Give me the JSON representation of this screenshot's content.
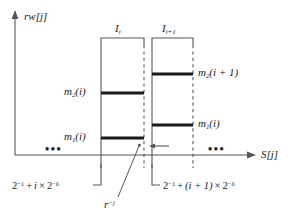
{
  "figure": {
    "background_color": "#ffffff",
    "line_color": "#555555",
    "bar_color": "#1a1a1a",
    "text_color": "#1a1a1a"
  },
  "axes": {
    "y_axis_label": "rw[j]",
    "y_axis_label_parts": {
      "name": "rw",
      "index": "[j]"
    },
    "x_axis_label": "S[j]",
    "x_axis_label_parts": {
      "name": "S",
      "index": "[j]"
    }
  },
  "intervals": [
    {
      "id": "I_i",
      "label_base": "I",
      "label_sub": "i",
      "bracket": true,
      "levels": [
        {
          "name": "m2(i)",
          "base": "m",
          "sub": "2",
          "arg": "(i)",
          "label_side": "left"
        },
        {
          "name": "m1(i)",
          "base": "m",
          "sub": "1",
          "arg": "(i)",
          "label_side": "left"
        }
      ],
      "bound_label": "2^-1 + i x 2^-delta",
      "bound_parts": {
        "two": "2",
        "exp1": "−1",
        "plus": "+",
        "i": "i",
        "times": "×",
        "two2": "2",
        "exp2": "−δ"
      }
    },
    {
      "id": "I_i+1",
      "label_base": "I",
      "label_sub": "i+1",
      "bracket": true,
      "levels": [
        {
          "name": "m2(i + 1)",
          "base": "m",
          "sub": "2",
          "arg": "(i + 1)",
          "label_side": "right"
        },
        {
          "name": "m1(i)",
          "base": "m",
          "sub": "1",
          "arg": "(i)",
          "label_side": "right"
        }
      ],
      "bound_label": "2^-1 + (i + 1) x 2^-delta",
      "bound_parts": {
        "two": "2",
        "exp1": "−1",
        "plus": "+",
        "i": "(i + 1)",
        "times": "×",
        "two2": "2",
        "exp2": "−δ"
      }
    }
  ],
  "annotations": {
    "step_label": "r−j",
    "step_label_parts": {
      "base": "r",
      "exp": "−j"
    },
    "ellipsis_left": "•••",
    "ellipsis_right": "•••"
  },
  "labels": {
    "m2_i": {
      "base": "m",
      "sub": "2",
      "arg": "(i)"
    },
    "m1_i": {
      "base": "m",
      "sub": "1",
      "arg": "(i)"
    },
    "m2_ip1": {
      "base": "m",
      "sub": "2",
      "arg": "(i + 1)"
    },
    "m1_ip1": {
      "base": "m",
      "sub": "1",
      "arg": "(i)"
    },
    "interval_1": {
      "base": "I",
      "sub": "i"
    },
    "interval_2": {
      "base": "I",
      "sub": "i+1"
    }
  }
}
